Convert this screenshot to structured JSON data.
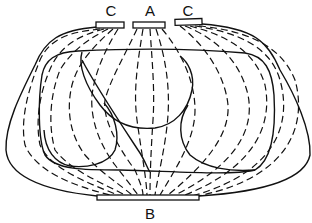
{
  "diagram": {
    "title": "",
    "labels": {
      "electrode_left": "C",
      "electrode_center": "A",
      "electrode_right": "C",
      "electrode_bottom": "B"
    },
    "colors": {
      "line": "#111111",
      "background": "#ffffff"
    },
    "elements": [
      "outer body outline",
      "inner thoracic outline",
      "heart outline",
      "lung outlines",
      "dashed current/field lines from electrodes A and C to electrode B"
    ]
  }
}
